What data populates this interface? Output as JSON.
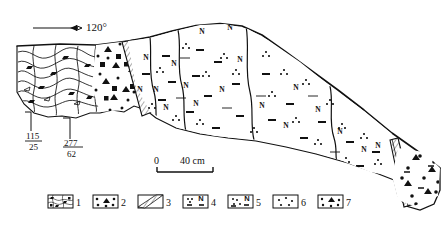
{
  "figure": {
    "type": "geological-cross-section",
    "orientation_symbol": {
      "label": "120°",
      "icon": "dip-direction-arrow"
    },
    "attitudes": [
      {
        "strike": "115",
        "dip": "25",
        "text": "115/25"
      },
      {
        "strike": "277",
        "dip": "62",
        "text": "277/62"
      }
    ],
    "scalebar": {
      "min_label": "0",
      "max_label": "40 cm",
      "unit": "cm",
      "length_value": 40
    },
    "unit_symbols": {
      "nodule_letter": "N",
      "dash": "—",
      "triangle": "▲",
      "square": "■",
      "dot": "•"
    }
  },
  "legend": {
    "items": [
      {
        "number": "1",
        "pattern": "folded-laminated-marl",
        "name": "deformed laminated marl"
      },
      {
        "number": "2",
        "pattern": "dots-with-black-triangles",
        "name": "clast-supported breccia"
      },
      {
        "number": "3",
        "pattern": "diagonal-hatched-band",
        "name": "neptunian dike"
      },
      {
        "number": "4",
        "pattern": "dots-dashes-with-N",
        "name": "nodular mudstone"
      },
      {
        "number": "5",
        "pattern": "dots-dashes-with-N-dense",
        "name": "nodular marly mudstone"
      },
      {
        "number": "6",
        "pattern": "sparse-dots",
        "name": "fine sandy matrix"
      },
      {
        "number": "7",
        "pattern": "dots-with-solid-triangle",
        "name": "pebbly conglomerate"
      }
    ]
  },
  "colors": {
    "ink": "#111111",
    "background": "#ffffff",
    "fill_light": "#ffffff"
  }
}
